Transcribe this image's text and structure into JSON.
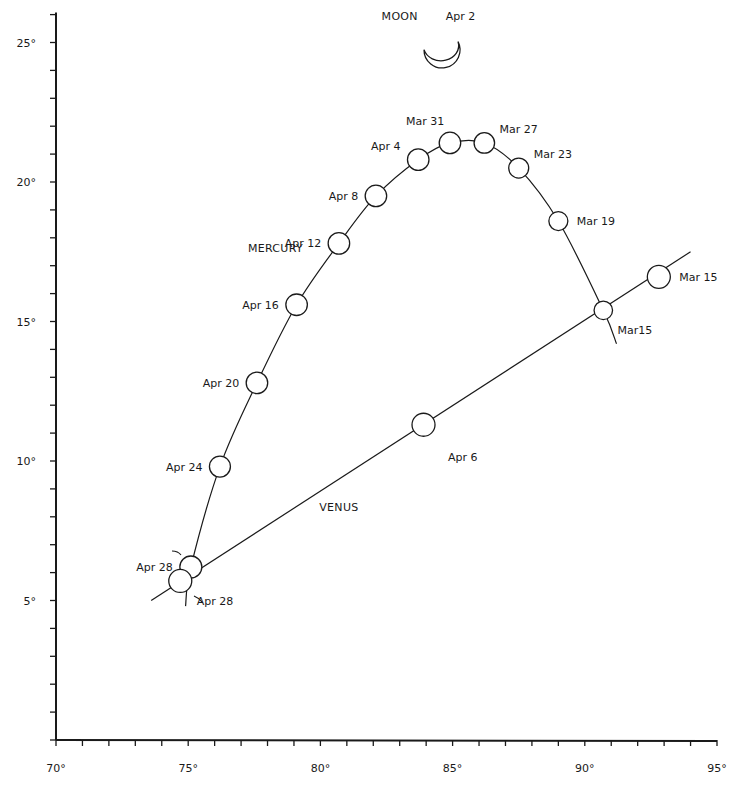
{
  "chart_data": {
    "type": "scatter",
    "title": "",
    "xlabel": "",
    "ylabel": "",
    "xlim": [
      70,
      95
    ],
    "ylim": [
      0,
      26
    ],
    "grid": false,
    "x_ticks": [
      {
        "value": 70,
        "label": "70°"
      },
      {
        "value": 75,
        "label": "75°"
      },
      {
        "value": 80,
        "label": "80°"
      },
      {
        "value": 85,
        "label": "85°"
      },
      {
        "value": 90,
        "label": "90°"
      },
      {
        "value": 95,
        "label": "95°"
      }
    ],
    "y_ticks": [
      {
        "value": 5,
        "label": "5°"
      },
      {
        "value": 10,
        "label": "10°"
      },
      {
        "value": 15,
        "label": "15°"
      },
      {
        "value": 20,
        "label": "20°"
      },
      {
        "value": 25,
        "label": "25°"
      }
    ],
    "minor_tick_step": 1,
    "series": [
      {
        "name": "MERCURY",
        "name_label_at": {
          "x": 78.3,
          "y": 17.5
        },
        "track_extends": {
          "start": {
            "x": 91.2,
            "y": 14.2
          },
          "end": {
            "x": 74.9,
            "y": 4.8
          }
        },
        "points": [
          {
            "date": "Mar15",
            "x": 90.7,
            "y": 15.4,
            "size": 0.45,
            "label_pos": "below-right"
          },
          {
            "date": "Mar 19",
            "x": 89.0,
            "y": 18.6,
            "size": 0.5,
            "label_pos": "right"
          },
          {
            "date": "Mar 23",
            "x": 87.5,
            "y": 20.5,
            "size": 0.6,
            "label_pos": "upper-right"
          },
          {
            "date": "Mar 27",
            "x": 86.2,
            "y": 21.4,
            "size": 0.65,
            "label_pos": "upper-right"
          },
          {
            "date": "Mar 31",
            "x": 84.9,
            "y": 21.4,
            "size": 0.75,
            "label_pos": "above-left"
          },
          {
            "date": "Apr 4",
            "x": 83.7,
            "y": 20.8,
            "size": 0.75,
            "label_pos": "upper-left"
          },
          {
            "date": "Apr 8",
            "x": 82.1,
            "y": 19.5,
            "size": 0.75,
            "label_pos": "left"
          },
          {
            "date": "Apr 12",
            "x": 80.7,
            "y": 17.8,
            "size": 0.75,
            "label_pos": "left"
          },
          {
            "date": "Apr 16",
            "x": 79.1,
            "y": 15.6,
            "size": 0.75,
            "label_pos": "left"
          },
          {
            "date": "Apr 20",
            "x": 77.6,
            "y": 12.8,
            "size": 0.75,
            "label_pos": "left"
          },
          {
            "date": "Apr 24",
            "x": 76.2,
            "y": 9.8,
            "size": 0.7,
            "label_pos": "left"
          },
          {
            "date": "Apr 28",
            "x": 75.1,
            "y": 6.2,
            "size": 0.8,
            "label_pos": "left"
          }
        ]
      },
      {
        "name": "VENUS",
        "name_label_at": {
          "x": 80.7,
          "y": 8.2
        },
        "track_extends": {
          "start": {
            "x": 94.0,
            "y": 17.5
          },
          "end": {
            "x": 73.6,
            "y": 5.0
          }
        },
        "points": [
          {
            "date": "Mar 15",
            "x": 92.8,
            "y": 16.6,
            "size": 0.9,
            "label_pos": "right"
          },
          {
            "date": "Apr 6",
            "x": 83.9,
            "y": 11.3,
            "size": 0.9,
            "label_pos": "below"
          },
          {
            "date": "Apr 28",
            "x": 74.7,
            "y": 5.7,
            "size": 0.9,
            "label_pos": "below-right"
          }
        ]
      }
    ],
    "annotations": [
      {
        "text": "MOON",
        "x": 83.0,
        "y": 25.8,
        "kind": "name"
      },
      {
        "text": "Apr 2",
        "x": 85.3,
        "y": 25.8,
        "kind": "date"
      },
      {
        "text": "crescent-moon",
        "x": 84.6,
        "y": 24.6,
        "kind": "symbol"
      }
    ]
  }
}
